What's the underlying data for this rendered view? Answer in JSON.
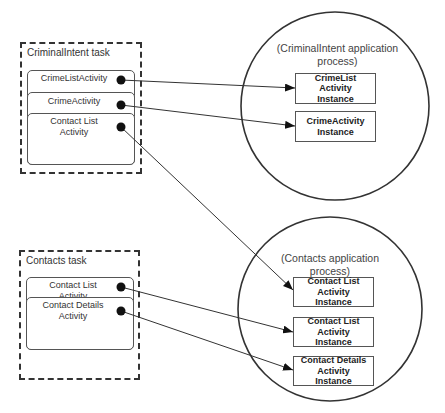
{
  "criminal_task": {
    "label": "CriminalIntent task",
    "activities": [
      {
        "label": "CrimeListActivity"
      },
      {
        "label": "CrimeActivity"
      },
      {
        "label": "Contact List\nActivity"
      }
    ]
  },
  "contacts_task": {
    "label": "Contacts task",
    "activities": [
      {
        "label": "Contact List\nActivity"
      },
      {
        "label": "Contact Details\nActivity"
      }
    ]
  },
  "criminal_process": {
    "label": "(CriminalIntent application\nprocess)",
    "instances": [
      {
        "label": "CrimeList\nActivity\nInstance"
      },
      {
        "label": "CrimeActivity\nInstance"
      }
    ]
  },
  "contacts_process": {
    "label": "(Contacts application\nprocess)",
    "instances": [
      {
        "label": "Contact List\nActivity\nInstance"
      },
      {
        "label": "Contact List\nActivity\nInstance"
      },
      {
        "label": "Contact Details\nActivity\nInstance"
      }
    ]
  },
  "connections": [
    {
      "from": "CrimeListActivity",
      "to": "CrimeList Activity Instance"
    },
    {
      "from": "CrimeActivity",
      "to": "CrimeActivity Instance"
    },
    {
      "from": "Contact List Activity (CriminalIntent task)",
      "to": "Contact List Activity Instance (1)"
    },
    {
      "from": "Contact List Activity (Contacts task)",
      "to": "Contact List Activity Instance (2)"
    },
    {
      "from": "Contact Details Activity",
      "to": "Contact Details Activity Instance"
    }
  ]
}
